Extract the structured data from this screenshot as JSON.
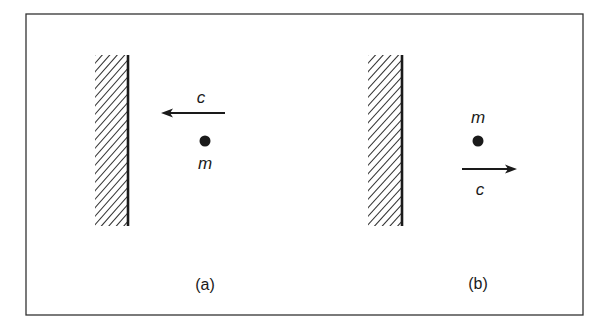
{
  "figure": {
    "frame": {
      "x": 26,
      "y": 14,
      "width": 557,
      "height": 301,
      "stroke": "#333333"
    },
    "panels": [
      {
        "id": "a",
        "caption": "(a)",
        "caption_pos": {
          "x": 205,
          "y": 285
        },
        "wall": {
          "x": 128,
          "top": 55,
          "bottom": 226,
          "hatch_left": 95
        },
        "arrow": {
          "label": "c",
          "from_x": 225,
          "to_x": 161,
          "y": 113,
          "direction": "left",
          "label_pos": {
            "x": 201,
            "y": 97
          }
        },
        "particle": {
          "label": "m",
          "x": 205,
          "y": 141,
          "label_pos": {
            "x": 205,
            "y": 163
          }
        }
      },
      {
        "id": "b",
        "caption": "(b)",
        "caption_pos": {
          "x": 478,
          "y": 284
        },
        "wall": {
          "x": 402,
          "top": 55,
          "bottom": 226,
          "hatch_left": 368
        },
        "arrow": {
          "label": "c",
          "from_x": 462,
          "to_x": 517,
          "y": 169,
          "direction": "right",
          "label_pos": {
            "x": 480,
            "y": 189
          }
        },
        "particle": {
          "label": "m",
          "x": 478,
          "y": 141,
          "label_pos": {
            "x": 478,
            "y": 117
          }
        }
      }
    ],
    "colors": {
      "ink": "#1a1a1a",
      "background": "#ffffff"
    }
  }
}
